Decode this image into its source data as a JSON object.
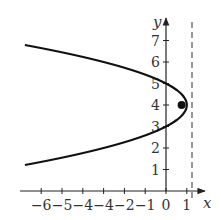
{
  "chart_data": {
    "type": "line",
    "title": "",
    "xlabel": "x",
    "ylabel": "y",
    "xlim": [
      -6.9,
      1.8
    ],
    "ylim": [
      -0.5,
      7.6
    ],
    "grid": false,
    "x_ticks": [
      -6,
      -5,
      -4,
      -3,
      -2,
      -1,
      0,
      1
    ],
    "x_tick_labels": [
      "−6",
      "−5",
      "−4",
      "−4",
      "−2",
      "−1",
      "0",
      "1"
    ],
    "y_ticks": [
      1,
      2,
      3,
      4,
      5,
      6,
      7
    ],
    "y_tick_labels": [
      "1",
      "2",
      "3",
      "4",
      "5",
      "6",
      "7"
    ],
    "series": [
      {
        "name": "parabola",
        "equation": "x = 1 - (y - 4)^2",
        "style": "solid",
        "color": "#111111",
        "y_range": [
          1.21,
          6.79
        ]
      },
      {
        "name": "vertical asymptote/directrix",
        "style": "dashed",
        "color": "#555555",
        "x": 1.25
      }
    ],
    "points": [
      {
        "label": "focus",
        "x": 0.75,
        "y": 4,
        "filled": true
      }
    ]
  }
}
